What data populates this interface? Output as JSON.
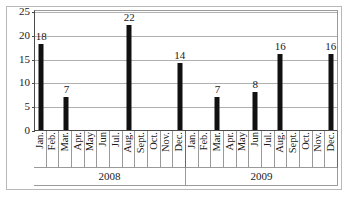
{
  "chart_data": {
    "type": "bar",
    "title": "",
    "subtitle": "",
    "xlabel": "",
    "ylabel": "",
    "ylim": [
      0,
      25
    ],
    "y_ticks": [
      0,
      5,
      10,
      15,
      20,
      25
    ],
    "grid": true,
    "legend": null,
    "bar_color": "#111111",
    "gridline_color": "#b0b0b0",
    "axis_color": "#4a4a4a",
    "categories": [
      "Jan.",
      "Feb.",
      "Mar.",
      "Apr.",
      "May",
      "Jun",
      "Jul.",
      "Aug.",
      "Sept.",
      "Oct.",
      "Nov.",
      "Dec.",
      "Jan.",
      "Feb.",
      "Mar.",
      "Apr.",
      "May",
      "Jun",
      "Jul.",
      "Aug.",
      "Sept.",
      "Oct.",
      "Nov.",
      "Dec."
    ],
    "values": [
      18,
      0,
      7,
      0,
      0,
      0,
      0,
      22,
      0,
      0,
      0,
      14,
      0,
      0,
      7,
      0,
      0,
      8,
      0,
      16,
      0,
      0,
      0,
      16
    ],
    "point_labels": [
      "18",
      "",
      "7",
      "",
      "",
      "",
      "",
      "22",
      "",
      "",
      "",
      "14",
      "",
      "",
      "7",
      "",
      "",
      "8",
      "",
      "16",
      "",
      "",
      "",
      "16"
    ],
    "groups": [
      {
        "label": "2008",
        "span": 12
      },
      {
        "label": "2009",
        "span": 12
      }
    ]
  }
}
